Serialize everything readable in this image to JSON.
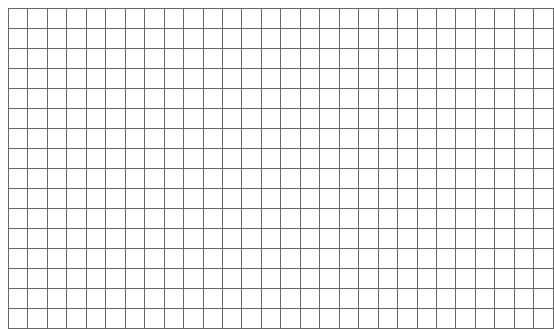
{
  "page": {
    "background_color": "#ffffff",
    "width": 554,
    "height": 318
  },
  "header": {
    "cropped_text": "                                    "
  },
  "grid": {
    "columns": 28,
    "rows": 16,
    "cell_width": 19.2,
    "cell_height": 19.0,
    "line_color": "#666666",
    "border_color": "#4a4a4a",
    "fill_color": "#ffffff",
    "cells": []
  }
}
